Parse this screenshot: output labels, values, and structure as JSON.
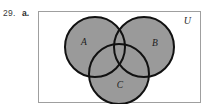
{
  "exercise": {
    "number": "29.",
    "part": "a."
  },
  "figure": {
    "name": "three-set-venn-diagram",
    "universal_set_label": "U",
    "shading_color": "#9a9a9a",
    "outline_color": "#111111",
    "frame_color": "#9f9f9f",
    "background_color": "#ffffff",
    "sets": [
      {
        "id": "A",
        "label": "A",
        "position": "upper-left",
        "cx": 56,
        "cy": 35,
        "r": 30
      },
      {
        "id": "B",
        "label": "B",
        "position": "upper-right",
        "cx": 105,
        "cy": 35,
        "r": 30
      },
      {
        "id": "C",
        "label": "C",
        "position": "bottom-center",
        "cx": 80,
        "cy": 62,
        "r": 30
      }
    ],
    "shaded_regions": [
      "A",
      "B",
      "C",
      "A∩B",
      "A∩C",
      "B∩C",
      "A∩B∩C"
    ],
    "shaded_description": "A ∪ B ∪ C (entire union shaded)"
  }
}
